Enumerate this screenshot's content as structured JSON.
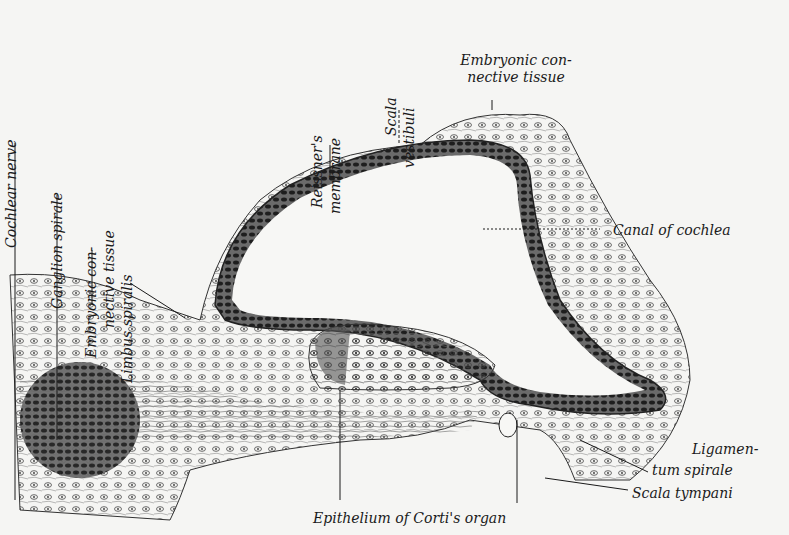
{
  "figure": {
    "labels": {
      "cochlear_nerve": "Cochlear nerve",
      "ganglion_spirale": "Ganglion spirale",
      "embryonic_ct_left_1": "Embryonic con-",
      "embryonic_ct_left_2": "nective tissue",
      "limbus_spiralis": "Limbus spiralis",
      "reissners_1": "Reissner's",
      "reissners_2": "membrane",
      "scala_vestibuli_1": "Scala",
      "scala_vestibuli_2": "vestibuli",
      "embryonic_ct_top_1": "Embryonic con-",
      "embryonic_ct_top_2": "nective tissue",
      "canal_of_cochlea": "Canal of cochlea",
      "ligamentum_1": "Ligamen-",
      "ligamentum_2": "tum spirale",
      "scala_tympani": "Scala tympani",
      "epithelium_corti": "Epithelium of Corti's organ"
    },
    "colors": {
      "ink": "#1a1a1a",
      "paper": "#f5f5f3",
      "tissue": "#e2e2de",
      "dense": "#3a3a3a"
    }
  }
}
